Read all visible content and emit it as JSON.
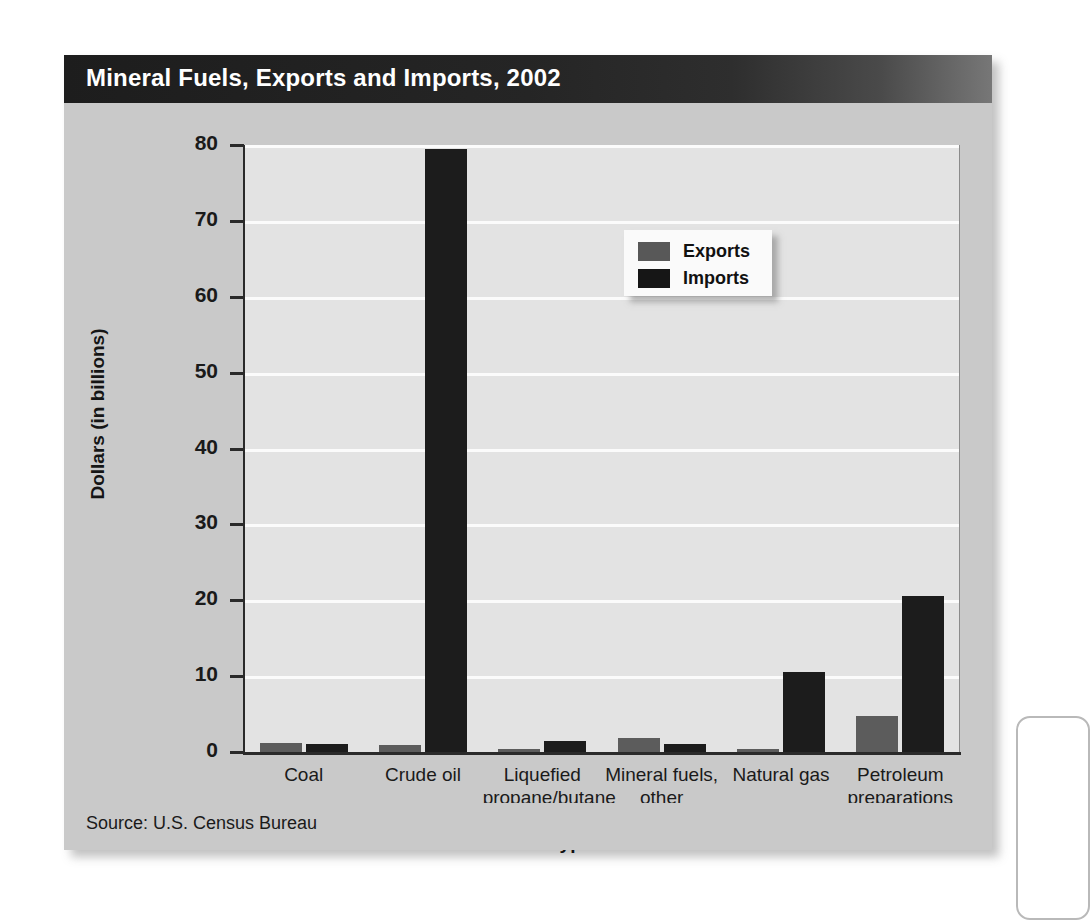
{
  "figure": {
    "title": "Mineral Fuels, Exports and Imports, 2002",
    "source": "Source:  U.S. Census Bureau",
    "colors": {
      "exports": "#5c5c5c",
      "imports": "#1c1c1c",
      "panel_background": "#c8c8c8",
      "plot_background": "#e3e3e3",
      "title_bar": "#1d1d1d",
      "gridline": "#fbfbfb",
      "axis": "#2a2a2a"
    }
  },
  "legend": {
    "position": "inside-top-right",
    "entries": [
      {
        "label": "Exports",
        "swatch": "exports"
      },
      {
        "label": "Imports",
        "swatch": "imports"
      }
    ]
  },
  "chart_data": {
    "type": "bar",
    "title": "Mineral Fuels, Exports and Imports, 2002",
    "xlabel": "Type of fuel",
    "ylabel": "Dollars (in billions)",
    "ylim": [
      0,
      80
    ],
    "yticks": [
      0,
      10,
      20,
      30,
      40,
      50,
      60,
      70,
      80
    ],
    "ytick_labels": [
      "0",
      "10",
      "20",
      "30",
      "40",
      "50",
      "60",
      "70",
      "80"
    ],
    "grid": true,
    "grid_axis": "y",
    "legend": [
      "Exports",
      "Imports"
    ],
    "categories": [
      "Coal",
      "Crude oil",
      "Liquefied propane/butane",
      "Mineral fuels, other",
      "Natural gas",
      "Petroleum preparations"
    ],
    "category_lines": [
      [
        "Coal"
      ],
      [
        "Crude oil"
      ],
      [
        "Liquefied",
        "propane/butane"
      ],
      [
        "Mineral fuels,",
        "other"
      ],
      [
        "Natural gas"
      ],
      [
        "Petroleum",
        "preparations"
      ]
    ],
    "series": [
      {
        "name": "Exports",
        "values": [
          1.2,
          0.9,
          0.4,
          1.8,
          0.4,
          4.8
        ]
      },
      {
        "name": "Imports",
        "values": [
          1.0,
          79.5,
          1.4,
          1.0,
          10.6,
          20.5
        ]
      }
    ],
    "units": "billions of dollars"
  }
}
